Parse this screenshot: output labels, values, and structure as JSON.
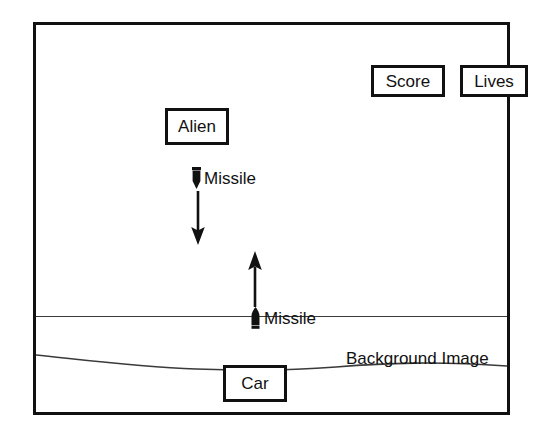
{
  "diagram": {
    "frame": {
      "name": "game-screen-frame",
      "border_color": "#111111",
      "background_color": "#ffffff"
    },
    "hud": {
      "score_box": {
        "label": "Score",
        "icon": "score-box"
      },
      "lives_box": {
        "label": "Lives",
        "icon": "lives-box"
      }
    },
    "entities": {
      "alien": {
        "label": "Alien"
      },
      "car": {
        "label": "Car"
      },
      "missile_down": {
        "label": "Missile",
        "icon": "missile-down-icon",
        "direction": "down"
      },
      "missile_up": {
        "label": "Missile",
        "icon": "missile-up-icon",
        "direction": "up"
      }
    },
    "background": {
      "label": "Background Image",
      "horizon_line": "ground-line",
      "road_line": "wavy-road-line"
    },
    "arrows": {
      "down_arrow": {
        "icon": "arrow-down-icon",
        "direction": "down"
      },
      "up_arrow": {
        "icon": "arrow-up-icon",
        "direction": "up"
      }
    },
    "colors": {
      "stroke": "#111111",
      "thin_stroke": "#3a3a3a",
      "fill": "#ffffff"
    }
  }
}
